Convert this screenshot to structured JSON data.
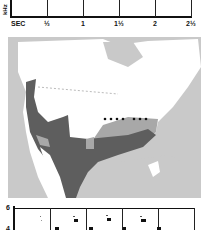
{
  "top_sonogram": {
    "y_axis_label": "kHz",
    "x_axis_unit": "SEC",
    "x_ticks": [
      "½",
      "1",
      "1½",
      "2",
      "2½"
    ]
  },
  "range_map": {
    "colors": {
      "ocean": "#c9c9c9",
      "land_outside_range": "#ffffff",
      "breeding_range": "#a8a8a8",
      "year_round_range": "#5e5e5e",
      "dotted_line": "#111111"
    }
  },
  "bottom_sonogram": {
    "y_ticks": [
      "6",
      "4"
    ]
  }
}
